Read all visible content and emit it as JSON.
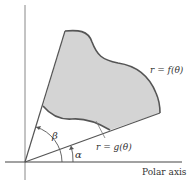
{
  "figure": {
    "labels": {
      "outer_curve": "r = f(θ)",
      "inner_curve": "r = g(θ)",
      "polar_axis": "Polar axis",
      "angle_alpha": "α",
      "angle_beta": "β"
    },
    "colors": {
      "region_fill": "#d4d4d4",
      "curve_stroke": "#555555",
      "axis_stroke": "#444444",
      "text": "#333333"
    }
  }
}
